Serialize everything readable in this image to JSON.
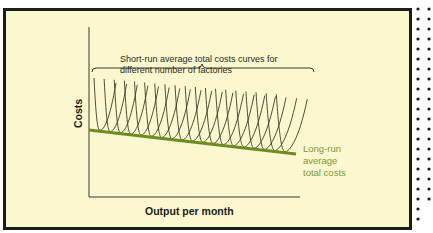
{
  "chart_data": {
    "type": "line",
    "title": "",
    "xlabel": "Output per month",
    "ylabel": "Costs",
    "annotations": [
      {
        "text": "Short-run average total costs curves for different number of factories",
        "lines": [
          "Short-run average total costs curves for",
          "different number of factories"
        ]
      },
      {
        "text": "Long-run average total costs",
        "lines": [
          "Long-run",
          "average",
          "total costs"
        ]
      }
    ],
    "series": [
      {
        "name": "Long-run average total costs",
        "color": "#6b8e23",
        "x": [
          0,
          1
        ],
        "y": [
          1.0,
          0.86
        ]
      },
      {
        "name": "Short-run average total costs curves",
        "color": "#3a3a2a",
        "count": 19,
        "description": "U-shaped curves tangent to the long-run line at successive output levels"
      }
    ],
    "grid": false,
    "legend": "none"
  },
  "colors": {
    "background": "#fbf8cf",
    "border": "#1c1c1c",
    "axis": "#3a3a2a",
    "lratc": "#6b8e23",
    "lratc_text": "#7a9a30"
  }
}
